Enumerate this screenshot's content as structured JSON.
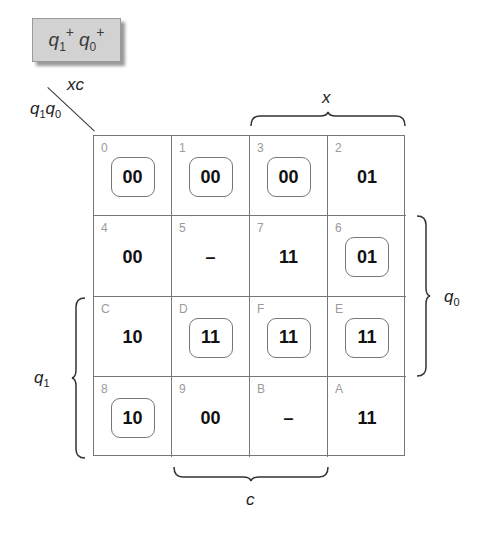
{
  "title": {
    "base1": "q",
    "sub1": "1",
    "sup1": "+",
    "base2": "q",
    "sub2": "0",
    "sup2": "+"
  },
  "axis_labels": {
    "columns_var": "xc",
    "rows_var_q": "q",
    "rows_var_sub1": "1",
    "rows_var_sub0": "0",
    "brace_x": "x",
    "brace_c": "c",
    "brace_q0": {
      "base": "q",
      "sub": "0"
    },
    "brace_q1": {
      "base": "q",
      "sub": "1"
    }
  },
  "kmap": {
    "cells": [
      [
        {
          "index": "0",
          "value": "00",
          "circled": true
        },
        {
          "index": "1",
          "value": "00",
          "circled": true
        },
        {
          "index": "3",
          "value": "00",
          "circled": true
        },
        {
          "index": "2",
          "value": "01",
          "circled": false
        }
      ],
      [
        {
          "index": "4",
          "value": "00",
          "circled": false
        },
        {
          "index": "5",
          "value": "–",
          "circled": false
        },
        {
          "index": "7",
          "value": "11",
          "circled": false
        },
        {
          "index": "6",
          "value": "01",
          "circled": true
        }
      ],
      [
        {
          "index": "C",
          "value": "10",
          "circled": false
        },
        {
          "index": "D",
          "value": "11",
          "circled": true
        },
        {
          "index": "F",
          "value": "11",
          "circled": true
        },
        {
          "index": "E",
          "value": "11",
          "circled": true
        }
      ],
      [
        {
          "index": "8",
          "value": "10",
          "circled": true
        },
        {
          "index": "9",
          "value": "00",
          "circled": false
        },
        {
          "index": "B",
          "value": "–",
          "circled": false
        },
        {
          "index": "A",
          "value": "11",
          "circled": false
        }
      ]
    ]
  }
}
